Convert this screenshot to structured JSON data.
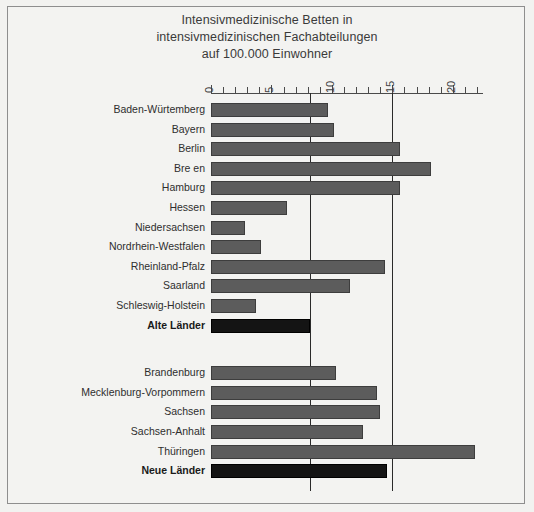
{
  "chart_data": {
    "type": "bar",
    "orientation": "horizontal",
    "title": "Intensivmedizinische Betten in intensivmedizinischen Fachabteilungen auf 100.000 Einwohner",
    "title_lines": [
      "Intensivmedizinische Betten in",
      "intensivmedizinischen Fachabteilungen",
      "auf 100.000 Einwohner"
    ],
    "xlabel": "",
    "ylabel": "",
    "xlim": [
      0,
      22.5
    ],
    "xticks": [
      0,
      5,
      10,
      15,
      20
    ],
    "xticklabels": [
      "0",
      "5",
      "10",
      "15",
      "20"
    ],
    "minor_tick_step": 1,
    "grid": false,
    "legend": "none",
    "axis_position": "top",
    "tick_label_rotation": -90,
    "reference_lines": [
      {
        "name": "alte-laender-mean",
        "value": 8.2
      },
      {
        "name": "neue-laender-mean",
        "value": 15.0
      }
    ],
    "groups": [
      {
        "name": "Alte Länder",
        "categories": [
          "Baden-Würtemberg",
          "Bayern",
          "Berlin",
          "Bre  en",
          "Hamburg",
          "Hessen",
          "Niedersachsen",
          "Nordrhein-Westfalen",
          "Rheinland-Pfalz",
          "Saarland",
          "Schleswig-Holstein",
          "Alte Länder"
        ],
        "values": [
          9.7,
          10.2,
          15.6,
          18.2,
          15.6,
          6.3,
          2.8,
          4.1,
          14.4,
          11.5,
          3.7,
          8.2
        ],
        "total_index": 11
      },
      {
        "name": "Neue Länder",
        "categories": [
          "Brandenburg",
          "Mecklenburg-Vorpommern",
          "Sachsen",
          "Sachsen-Anhalt",
          "Thüringen",
          "Neue Länder"
        ],
        "values": [
          10.3,
          13.7,
          14.0,
          12.6,
          21.8,
          14.6
        ],
        "total_index": 5
      }
    ],
    "colors": {
      "bar": "#5c5c5c",
      "bar_edge": "#3d3d3d",
      "total_bar": "#141414",
      "background": "#f3f3f1",
      "axis": "#4a4a4a",
      "reference_line": "#2a2a2a",
      "text": "#2e2e2e",
      "frame": "#8e8e8e"
    }
  }
}
